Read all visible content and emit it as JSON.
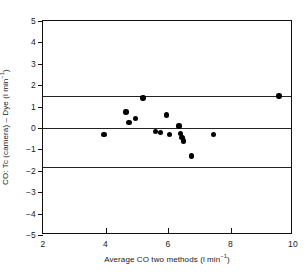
{
  "chart_data": {
    "type": "scatter",
    "title": "",
    "xlabel": "Average  CO two methods (l min⁻¹)",
    "ylabel": "CO: Tc (camera) – Dye (l min⁻¹)",
    "xlim": [
      2,
      10
    ],
    "ylim": [
      -5,
      5
    ],
    "grid": false,
    "legend": null,
    "xticks": [
      2,
      4,
      6,
      8,
      10
    ],
    "xtick_labels": [
      "2",
      "4",
      "6",
      "8",
      "10"
    ],
    "yticks": [
      -5,
      -4,
      -3,
      -2,
      -1,
      0,
      1,
      2,
      3,
      4,
      5
    ],
    "ytick_labels": [
      "-5",
      "-4",
      "-3",
      "-2",
      "-1",
      "0",
      "1",
      "2",
      "3",
      "4",
      "5"
    ],
    "reference_lines": [
      {
        "name": "upper-limit-of-agreement",
        "y": 1.5
      },
      {
        "name": "mean-difference",
        "y": 0.0
      },
      {
        "name": "lower-limit-of-agreement",
        "y": -1.8
      }
    ],
    "points": [
      {
        "x": 3.95,
        "y": -0.3
      },
      {
        "x": 4.65,
        "y": 0.75
      },
      {
        "x": 4.75,
        "y": 0.25
      },
      {
        "x": 4.95,
        "y": 0.45
      },
      {
        "x": 5.2,
        "y": 1.4
      },
      {
        "x": 5.6,
        "y": -0.15
      },
      {
        "x": 5.75,
        "y": -0.2
      },
      {
        "x": 5.95,
        "y": 0.6
      },
      {
        "x": 6.05,
        "y": -0.3
      },
      {
        "x": 6.35,
        "y": 0.1
      },
      {
        "x": 6.4,
        "y": -0.25
      },
      {
        "x": 6.45,
        "y": -0.45
      },
      {
        "x": 6.5,
        "y": -0.6
      },
      {
        "x": 6.75,
        "y": -1.3
      },
      {
        "x": 7.45,
        "y": -0.3
      },
      {
        "x": 9.55,
        "y": 1.5
      }
    ]
  }
}
